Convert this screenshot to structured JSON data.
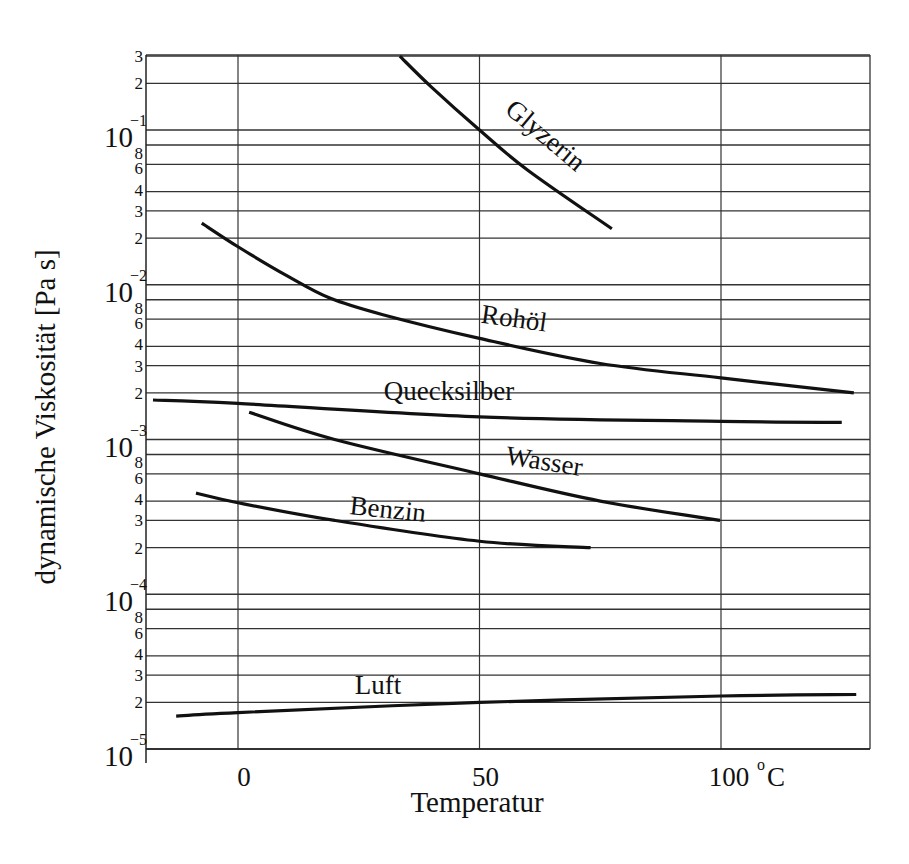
{
  "chart_data": {
    "type": "line",
    "title": "",
    "xlabel": "Temperatur",
    "ylabel": "dynamische Viskosität [Pa s]",
    "x_unit_label": "°C",
    "xlim": [
      -19,
      130
    ],
    "ylim": [
      1e-05,
      0.3
    ],
    "yscale": "log",
    "grid": true,
    "x_ticks": [
      {
        "value": 0,
        "label": "0"
      },
      {
        "value": 50,
        "label": "50"
      },
      {
        "value": 100,
        "label": "100"
      }
    ],
    "y_decades": [
      {
        "exp": -1,
        "base": "10",
        "sup": "−1"
      },
      {
        "exp": -2,
        "base": "10",
        "sup": "−2"
      },
      {
        "exp": -3,
        "base": "10",
        "sup": "−3"
      },
      {
        "exp": -4,
        "base": "10",
        "sup": "−4"
      },
      {
        "exp": -5,
        "base": "10",
        "sup": "−5"
      }
    ],
    "y_minor_labels": [
      "8",
      "6",
      "4",
      "3",
      "2"
    ],
    "y_top_labels": [
      "3",
      "2"
    ],
    "series": [
      {
        "name": "Glyzerin",
        "x": [
          33.5,
          40,
          50,
          60,
          77.4
        ],
        "values": [
          0.3,
          0.19,
          0.1,
          0.055,
          0.023
        ],
        "label": {
          "text": "Glyzerin",
          "x": 540,
          "y": 142,
          "rotate": 40
        }
      },
      {
        "name": "Rohöl",
        "x": [
          -7.5,
          0,
          10,
          19,
          30,
          50,
          75,
          100,
          127.5
        ],
        "values": [
          0.025,
          0.0176,
          0.0115,
          0.0082,
          0.0064,
          0.0045,
          0.0031,
          0.0025,
          0.002
        ],
        "label": {
          "text": "Rohöl",
          "x": 513,
          "y": 327,
          "rotate": 8
        }
      },
      {
        "name": "Quecksilber",
        "x": [
          -17.6,
          0,
          50,
          100,
          125
        ],
        "values": [
          0.0018,
          0.00171,
          0.0014,
          0.00131,
          0.00129
        ],
        "label": {
          "text": "Quecksilber",
          "x": 449,
          "y": 400,
          "rotate": 0
        }
      },
      {
        "name": "Wasser",
        "x": [
          2.3,
          20,
          50,
          75,
          99.8
        ],
        "values": [
          0.0015,
          0.001,
          0.0006,
          0.0004,
          0.0003
        ],
        "label": {
          "text": "Wasser",
          "x": 543,
          "y": 470,
          "rotate": 9
        }
      },
      {
        "name": "Benzin",
        "x": [
          -8.7,
          0,
          20,
          50,
          73
        ],
        "values": [
          0.00045,
          0.00039,
          0.0003,
          0.00022,
          0.0002
        ],
        "label": {
          "text": "Benzin",
          "x": 387,
          "y": 518,
          "rotate": 6
        }
      },
      {
        "name": "Luft",
        "x": [
          -12.8,
          0,
          50,
          100,
          128
        ],
        "values": [
          1.63e-05,
          1.72e-05,
          2e-05,
          2.2e-05,
          2.25e-05
        ],
        "label": {
          "text": "Luft",
          "x": 378,
          "y": 694,
          "rotate": 0
        }
      }
    ]
  },
  "layout": {
    "plot_left": 146,
    "plot_right": 870,
    "plot_top": 55,
    "plot_bottom": 749,
    "x0_px": 238,
    "px_per_deg": 4.83,
    "y_decade_m1_px": 130,
    "px_per_decade": 154.75
  }
}
